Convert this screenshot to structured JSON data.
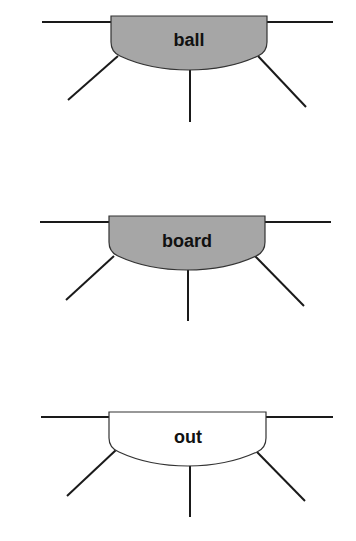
{
  "diagram": {
    "colors": {
      "filled": "#a6a6a6",
      "unfilled": "#ffffff",
      "line": "#1a1a1a",
      "text": "#111111"
    },
    "nodes": [
      {
        "label": "ball",
        "filled": true
      },
      {
        "label": "board",
        "filled": true
      },
      {
        "label": "out",
        "filled": false
      }
    ]
  }
}
